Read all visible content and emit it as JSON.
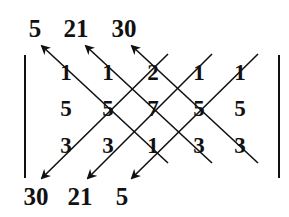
{
  "top_sums": [
    {
      "label": "5",
      "x": 35,
      "y": 28
    },
    {
      "label": "21",
      "x": 76,
      "y": 28
    },
    {
      "label": "30",
      "x": 124,
      "y": 28
    }
  ],
  "bottom_sums": [
    {
      "label": "30",
      "x": 36,
      "y": 196
    },
    {
      "label": "21",
      "x": 80,
      "y": 196
    },
    {
      "label": "5",
      "x": 122,
      "y": 196
    }
  ],
  "matrix": {
    "rows": [
      [
        "1",
        "1",
        "2",
        "1",
        "1"
      ],
      [
        "5",
        "5",
        "7",
        "5",
        "5"
      ],
      [
        "3",
        "3",
        "1",
        "3",
        "3"
      ]
    ],
    "col_x": [
      66,
      108,
      153,
      199,
      240
    ],
    "row_y": [
      72,
      108,
      145
    ]
  },
  "colors": {
    "ink": "#111111",
    "background": "#ffffff"
  }
}
